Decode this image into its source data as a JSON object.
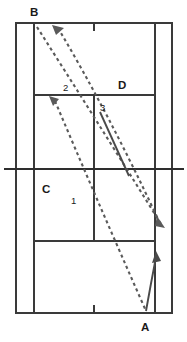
{
  "diagram": {
    "background_color": "#ffffff",
    "line_color": "#3a3a3a",
    "trajectory_color": "#5a5a5a",
    "label_color": "#1a1a1a",
    "corner_labels": [
      {
        "text": "B",
        "x": 30,
        "y": 7
      },
      {
        "text": "D",
        "x": 118,
        "y": 80
      },
      {
        "text": "C",
        "x": 42,
        "y": 184
      },
      {
        "text": "A",
        "x": 141,
        "y": 322
      }
    ],
    "shot_labels": [
      {
        "text": "2",
        "x": 63,
        "y": 83
      },
      {
        "text": "3",
        "x": 100,
        "y": 103
      },
      {
        "text": "1",
        "x": 71,
        "y": 196
      }
    ],
    "court": {
      "outer_left": 16,
      "outer_right": 172,
      "inner_left": 34,
      "inner_right": 155,
      "top": 23,
      "bottom": 313,
      "net_y": 169,
      "net_left": 4,
      "net_right": 184,
      "service_line_top_y": 95,
      "service_line_bottom_y": 241,
      "center_line_x": 94,
      "center_tick_top": [
        23,
        31
      ],
      "center_tick_bottom": [
        305,
        313
      ]
    },
    "trajectories": [
      {
        "name": "shot-1",
        "style": "dashed",
        "from": [
          53,
          99
        ],
        "to": [
          146,
          312
        ]
      },
      {
        "name": "shot-2",
        "style": "dashed",
        "from": [
          37,
          27
        ],
        "to": [
          161,
          226
        ]
      },
      {
        "name": "shot-3",
        "style": "dashed",
        "from": [
          58,
          28
        ],
        "to": [
          160,
          222
        ]
      },
      {
        "name": "shot-3-solid-segment",
        "style": "solid",
        "from": [
          100,
          112
        ],
        "to": [
          129,
          176
        ]
      },
      {
        "name": "return-stroke",
        "style": "solid",
        "from": [
          146,
          311
        ],
        "to": [
          156,
          254
        ]
      }
    ]
  }
}
